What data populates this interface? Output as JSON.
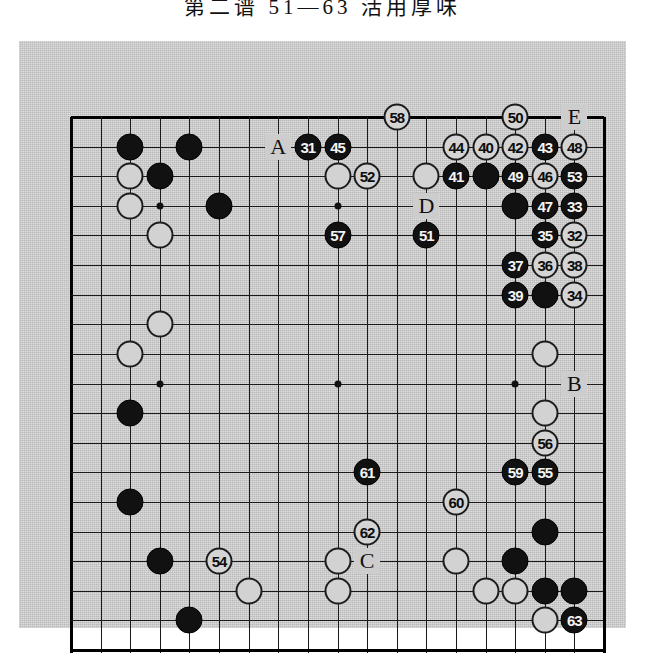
{
  "title": "第二谱  51—63  活用厚味",
  "board": {
    "size": 19,
    "colors": {
      "black": "#111111",
      "white": "#d2d2d2",
      "line": "#1a1a1a",
      "background": "#cdcdcd"
    },
    "hoshi": [
      [
        3,
        3
      ],
      [
        9,
        3
      ],
      [
        15,
        3
      ],
      [
        3,
        9
      ],
      [
        9,
        9
      ],
      [
        15,
        9
      ],
      [
        3,
        15
      ],
      [
        9,
        15
      ],
      [
        15,
        15
      ]
    ],
    "plain_stones": [
      {
        "c": "b",
        "col": 2,
        "row": 1
      },
      {
        "c": "b",
        "col": 4,
        "row": 1
      },
      {
        "c": "w",
        "col": 2,
        "row": 2
      },
      {
        "c": "b",
        "col": 3,
        "row": 2
      },
      {
        "c": "w",
        "col": 9,
        "row": 2
      },
      {
        "c": "w",
        "col": 12,
        "row": 2
      },
      {
        "c": "b",
        "col": 14,
        "row": 2
      },
      {
        "c": "w",
        "col": 2,
        "row": 3
      },
      {
        "c": "b",
        "col": 5,
        "row": 3
      },
      {
        "c": "b",
        "col": 15,
        "row": 3
      },
      {
        "c": "w",
        "col": 3,
        "row": 4
      },
      {
        "c": "b",
        "col": 16,
        "row": 6
      },
      {
        "c": "w",
        "col": 3,
        "row": 7
      },
      {
        "c": "w",
        "col": 2,
        "row": 8
      },
      {
        "c": "w",
        "col": 16,
        "row": 8
      },
      {
        "c": "b",
        "col": 2,
        "row": 10
      },
      {
        "c": "w",
        "col": 16,
        "row": 10
      },
      {
        "c": "b",
        "col": 2,
        "row": 13
      },
      {
        "c": "b",
        "col": 16,
        "row": 14
      },
      {
        "c": "b",
        "col": 3,
        "row": 15
      },
      {
        "c": "w",
        "col": 9,
        "row": 15
      },
      {
        "c": "w",
        "col": 13,
        "row": 15
      },
      {
        "c": "b",
        "col": 15,
        "row": 15
      },
      {
        "c": "w",
        "col": 6,
        "row": 16
      },
      {
        "c": "w",
        "col": 9,
        "row": 16
      },
      {
        "c": "w",
        "col": 14,
        "row": 16
      },
      {
        "c": "w",
        "col": 15,
        "row": 16
      },
      {
        "c": "b",
        "col": 16,
        "row": 16
      },
      {
        "c": "b",
        "col": 17,
        "row": 16
      },
      {
        "c": "b",
        "col": 4,
        "row": 17
      },
      {
        "c": "w",
        "col": 16,
        "row": 17
      }
    ],
    "numbered_moves": [
      {
        "n": "31",
        "c": "b",
        "col": 8,
        "row": 1
      },
      {
        "n": "32",
        "c": "w",
        "col": 17,
        "row": 4
      },
      {
        "n": "33",
        "c": "b",
        "col": 17,
        "row": 3
      },
      {
        "n": "34",
        "c": "w",
        "col": 17,
        "row": 6
      },
      {
        "n": "35",
        "c": "b",
        "col": 16,
        "row": 4
      },
      {
        "n": "36",
        "c": "w",
        "col": 16,
        "row": 5
      },
      {
        "n": "37",
        "c": "b",
        "col": 15,
        "row": 5
      },
      {
        "n": "38",
        "c": "w",
        "col": 17,
        "row": 5
      },
      {
        "n": "39",
        "c": "b",
        "col": 15,
        "row": 6
      },
      {
        "n": "40",
        "c": "w",
        "col": 14,
        "row": 1
      },
      {
        "n": "41",
        "c": "b",
        "col": 13,
        "row": 2
      },
      {
        "n": "42",
        "c": "w",
        "col": 15,
        "row": 1
      },
      {
        "n": "43",
        "c": "b",
        "col": 16,
        "row": 1
      },
      {
        "n": "44",
        "c": "w",
        "col": 13,
        "row": 1
      },
      {
        "n": "45",
        "c": "b",
        "col": 9,
        "row": 1
      },
      {
        "n": "46",
        "c": "w",
        "col": 16,
        "row": 2
      },
      {
        "n": "47",
        "c": "b",
        "col": 16,
        "row": 3
      },
      {
        "n": "48",
        "c": "w",
        "col": 17,
        "row": 1
      },
      {
        "n": "49",
        "c": "b",
        "col": 15,
        "row": 2
      },
      {
        "n": "50",
        "c": "w",
        "col": 15,
        "row": 0
      },
      {
        "n": "51",
        "c": "b",
        "col": 12,
        "row": 4
      },
      {
        "n": "52",
        "c": "w",
        "col": 10,
        "row": 2
      },
      {
        "n": "53",
        "c": "b",
        "col": 17,
        "row": 2
      },
      {
        "n": "54",
        "c": "w",
        "col": 5,
        "row": 15
      },
      {
        "n": "55",
        "c": "b",
        "col": 16,
        "row": 12
      },
      {
        "n": "56",
        "c": "w",
        "col": 16,
        "row": 11
      },
      {
        "n": "57",
        "c": "b",
        "col": 9,
        "row": 4
      },
      {
        "n": "58",
        "c": "w",
        "col": 11,
        "row": 0
      },
      {
        "n": "59",
        "c": "b",
        "col": 15,
        "row": 12
      },
      {
        "n": "60",
        "c": "w",
        "col": 13,
        "row": 13
      },
      {
        "n": "61",
        "c": "b",
        "col": 10,
        "row": 12
      },
      {
        "n": "62",
        "c": "w",
        "col": 10,
        "row": 14
      },
      {
        "n": "63",
        "c": "b",
        "col": 17,
        "row": 17
      }
    ],
    "letter_labels": [
      {
        "t": "A",
        "col": 7,
        "row": 1
      },
      {
        "t": "B",
        "col": 17,
        "row": 9
      },
      {
        "t": "C",
        "col": 10,
        "row": 15
      },
      {
        "t": "D",
        "col": 12,
        "row": 3
      },
      {
        "t": "E",
        "col": 17,
        "row": 0
      }
    ]
  }
}
